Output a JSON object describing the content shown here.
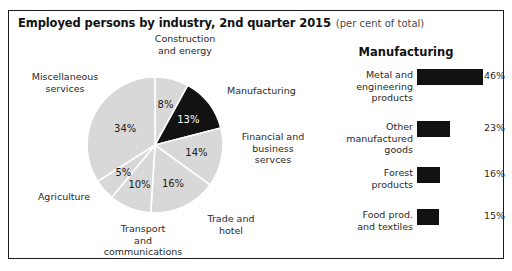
{
  "figure": {
    "title_main": "Employed persons by industry, 2nd quarter 2015",
    "title_sub": "(per cent of total)",
    "border_color": "#1c1c1c",
    "background": "#ffffff"
  },
  "chart_data": [
    {
      "type": "pie",
      "title": "Employed persons by industry, 2nd quarter 2015",
      "units": "per cent of total",
      "categories": [
        "Construction and energy",
        "Manufacturing",
        "Financial and business servces",
        "Trade and hotel",
        "Transport and communications",
        "Agriculture",
        "Miscellaneous services"
      ],
      "values": [
        8,
        13,
        14,
        16,
        10,
        5,
        34
      ],
      "value_labels": [
        "8%",
        "13%",
        "14%",
        "16%",
        "10%",
        "5%",
        "34%"
      ],
      "colors": [
        "#d8d8d8",
        "#121212",
        "#d8d8d8",
        "#d8d8d8",
        "#d8d8d8",
        "#d8d8d8",
        "#d8d8d8"
      ],
      "highlight_category": "Manufacturing",
      "highlight_color": "#121212",
      "slice_color": "#d8d8d8",
      "separator_color": "#ffffff",
      "start_angle_deg": 0,
      "direction": "clockwise",
      "legend": "none",
      "labels_placement": "outside-callouts"
    },
    {
      "type": "bar",
      "orientation": "horizontal",
      "title": "Manufacturing",
      "categories": [
        "Metal and engineering products",
        "Other manufactured goods",
        "Forest products",
        "Food prod. and textiles"
      ],
      "values": [
        46,
        23,
        16,
        15
      ],
      "value_labels": [
        "46%",
        "23%",
        "16%",
        "15%"
      ],
      "bar_color": "#121212",
      "xlabel": "",
      "ylabel": "",
      "xlim": [
        0,
        46
      ],
      "grid": false,
      "legend": "none"
    }
  ],
  "pie": {
    "callouts": [
      {
        "name": "construction-and-energy",
        "text": "Construction\nand energy"
      },
      {
        "name": "manufacturing",
        "text": "Manufacturing"
      },
      {
        "name": "financial-and-business-services",
        "text": "Financial and\nbusiness\nservces"
      },
      {
        "name": "trade-and-hotel",
        "text": "Trade and\nhotel"
      },
      {
        "name": "transport-and-communications",
        "text": "Transport\nand\ncommunications"
      },
      {
        "name": "agriculture",
        "text": "Agriculture"
      },
      {
        "name": "miscellaneous-services",
        "text": "Miscellaneous\nservices"
      }
    ],
    "slice_labels": [
      "8%",
      "13%",
      "14%",
      "16%",
      "10%",
      "5%",
      "34%"
    ]
  },
  "bars": {
    "heading": "Manufacturing",
    "rows": [
      {
        "label": "Metal and\nengineering\nproducts",
        "value_label": "46%",
        "value": 46
      },
      {
        "label": "Other\nmanufactured\ngoods",
        "value_label": "23%",
        "value": 23
      },
      {
        "label": "Forest\nproducts",
        "value_label": "16%",
        "value": 16
      },
      {
        "label": "Food prod.\nand textiles",
        "value_label": "15%",
        "value": 15
      }
    ]
  }
}
